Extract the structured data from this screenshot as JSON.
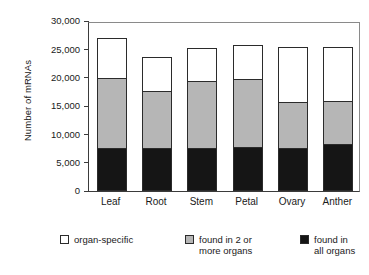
{
  "chart_data": {
    "type": "bar",
    "subtype": "stacked-bar",
    "title": "",
    "subtitle": "",
    "xlabel": "",
    "ylabel": "Number of mRNAs",
    "categories": [
      "Leaf",
      "Root",
      "Stem",
      "Petal",
      "Ovary",
      "Anther"
    ],
    "series": [
      {
        "name": "found in all organs",
        "color": "#151515",
        "values": [
          7500,
          7500,
          7600,
          7700,
          7500,
          8200
        ]
      },
      {
        "name": "found in 2 or more organs",
        "color": "#b6b6b6",
        "values": [
          12500,
          10200,
          11900,
          12100,
          8200,
          7700
        ]
      },
      {
        "name": "organ-specific",
        "color": "#ffffff",
        "values": [
          7000,
          6000,
          5700,
          6000,
          9700,
          9600
        ]
      }
    ],
    "cumulative_tops": {
      "found in all organs": [
        7500,
        7500,
        7600,
        7700,
        7500,
        8200
      ],
      "found in 2 or more organs": [
        20000,
        17700,
        19500,
        19800,
        15700,
        15900
      ],
      "organ-specific": [
        27000,
        23700,
        25200,
        25800,
        25400,
        25500
      ]
    },
    "totals": [
      27000,
      23700,
      25200,
      25800,
      25400,
      25500
    ],
    "ylim": [
      0,
      30000
    ],
    "ytick_values": [
      0,
      5000,
      10000,
      15000,
      20000,
      25000,
      30000
    ],
    "ytick_labels": [
      "0",
      "5,000",
      "10,000",
      "15,000",
      "20,000",
      "25,000",
      "30,000"
    ],
    "grid": false,
    "legend_position": "bottom"
  },
  "axes": {
    "y_title": "Number of mRNAs"
  },
  "legend": {
    "items": [
      {
        "label": "organ-specific",
        "swatch": "white"
      },
      {
        "label": "found in 2 or\nmore organs",
        "swatch": "gray"
      },
      {
        "label": "found in\nall organs",
        "swatch": "black"
      }
    ]
  }
}
